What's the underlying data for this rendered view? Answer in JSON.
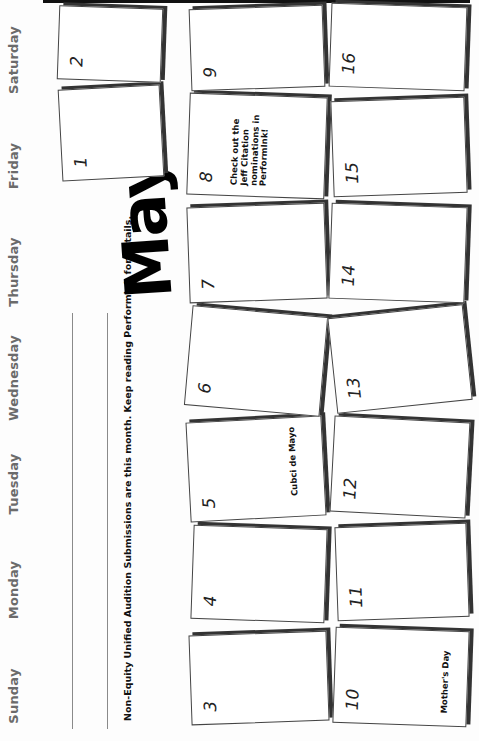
{
  "calendar": {
    "month": "May",
    "day_names": [
      "Sunday",
      "Monday",
      "Tuesday",
      "Wednesday",
      "Thursday",
      "Friday",
      "Saturday"
    ],
    "note": "Non-Equity Unified Audition Submissions are this month. Keep reading PerformInk for details.",
    "days": [
      {
        "num": "1",
        "event": ""
      },
      {
        "num": "2",
        "event": ""
      },
      {
        "num": "3",
        "event": ""
      },
      {
        "num": "4",
        "event": ""
      },
      {
        "num": "5",
        "event": "Cubci de Mayo"
      },
      {
        "num": "6",
        "event": ""
      },
      {
        "num": "7",
        "event": ""
      },
      {
        "num": "8",
        "event": "Check out the Jeff Citation nominations in PerformInk!"
      },
      {
        "num": "9",
        "event": ""
      },
      {
        "num": "10",
        "event": "Mother's Day"
      },
      {
        "num": "11",
        "event": ""
      },
      {
        "num": "12",
        "event": ""
      },
      {
        "num": "13",
        "event": ""
      },
      {
        "num": "14",
        "event": ""
      },
      {
        "num": "15",
        "event": ""
      },
      {
        "num": "16",
        "event": ""
      }
    ]
  }
}
